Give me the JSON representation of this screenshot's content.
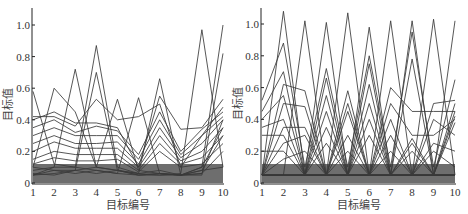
{
  "chart_data": [
    {
      "type": "line",
      "title": "",
      "xlabel": "目标编号",
      "ylabel": "目标值",
      "x": [
        1,
        2,
        3,
        4,
        5,
        6,
        7,
        8,
        9,
        10
      ],
      "xticks": [
        "1",
        "2",
        "3",
        "4",
        "5",
        "6",
        "7",
        "8",
        "9",
        "10"
      ],
      "yticks": [
        "0",
        "0.2",
        "0.4",
        "0.6",
        "0.8",
        "1.0"
      ],
      "ylim": [
        0,
        1.1
      ],
      "grid": false,
      "legend": "none",
      "line_color": "#3a3a3a",
      "series": [
        {
          "name": "s1",
          "values": [
            0.58,
            0.12,
            0.1,
            0.08,
            0.06,
            0.05,
            0.05,
            0.06,
            0.97,
            0.1
          ]
        },
        {
          "name": "s2",
          "values": [
            0.1,
            0.6,
            0.45,
            0.1,
            0.08,
            0.05,
            0.06,
            0.05,
            0.1,
            1.0
          ]
        },
        {
          "name": "s3",
          "values": [
            0.05,
            0.1,
            0.72,
            0.1,
            0.08,
            0.06,
            0.05,
            0.05,
            0.05,
            0.82
          ]
        },
        {
          "name": "s4",
          "values": [
            0.08,
            0.1,
            0.1,
            0.87,
            0.1,
            0.06,
            0.08,
            0.05,
            0.08,
            0.1
          ]
        },
        {
          "name": "s5",
          "values": [
            0.05,
            0.06,
            0.08,
            0.7,
            0.08,
            0.05,
            0.06,
            0.05,
            0.06,
            0.4
          ]
        },
        {
          "name": "s6",
          "values": [
            0.1,
            0.08,
            0.08,
            0.1,
            0.53,
            0.08,
            0.06,
            0.05,
            0.08,
            0.3
          ]
        },
        {
          "name": "s7",
          "values": [
            0.05,
            0.08,
            0.06,
            0.08,
            0.06,
            0.54,
            0.06,
            0.05,
            0.06,
            0.2
          ]
        },
        {
          "name": "s8",
          "values": [
            0.06,
            0.05,
            0.08,
            0.06,
            0.08,
            0.06,
            0.66,
            0.05,
            0.1,
            0.35
          ]
        },
        {
          "name": "s9",
          "values": [
            0.4,
            0.45,
            0.38,
            0.38,
            0.35,
            0.1,
            0.55,
            0.34,
            0.35,
            0.53
          ]
        },
        {
          "name": "s10",
          "values": [
            0.42,
            0.42,
            0.36,
            0.53,
            0.4,
            0.42,
            0.5,
            0.1,
            0.3,
            0.48
          ]
        },
        {
          "name": "s11",
          "values": [
            0.35,
            0.4,
            0.32,
            0.36,
            0.33,
            0.18,
            0.45,
            0.2,
            0.34,
            0.45
          ]
        },
        {
          "name": "s12",
          "values": [
            0.3,
            0.35,
            0.3,
            0.3,
            0.3,
            0.15,
            0.4,
            0.18,
            0.3,
            0.42
          ]
        },
        {
          "name": "s13",
          "values": [
            0.25,
            0.3,
            0.25,
            0.25,
            0.26,
            0.12,
            0.35,
            0.16,
            0.25,
            0.4
          ]
        },
        {
          "name": "s14",
          "values": [
            0.2,
            0.26,
            0.22,
            0.22,
            0.22,
            0.1,
            0.3,
            0.14,
            0.2,
            0.35
          ]
        },
        {
          "name": "s15",
          "values": [
            0.15,
            0.2,
            0.18,
            0.18,
            0.18,
            0.08,
            0.25,
            0.12,
            0.16,
            0.3
          ]
        },
        {
          "name": "s16",
          "values": [
            0.12,
            0.16,
            0.14,
            0.14,
            0.15,
            0.07,
            0.2,
            0.1,
            0.12,
            0.25
          ]
        }
      ]
    },
    {
      "type": "line",
      "title": "",
      "xlabel": "目标编号",
      "ylabel": "目标值",
      "x": [
        1,
        2,
        3,
        4,
        5,
        6,
        7,
        8,
        9,
        10
      ],
      "xticks": [
        "1",
        "2",
        "3",
        "4",
        "5",
        "6",
        "7",
        "8",
        "9",
        "10"
      ],
      "yticks": [
        "0",
        "0.2",
        "0.4",
        "0.6",
        "0.8",
        "1.0"
      ],
      "ylim": [
        0,
        1.1
      ],
      "grid": false,
      "legend": "none",
      "line_color": "#3a3a3a",
      "series": [
        {
          "name": "r1",
          "values": [
            0.05,
            1.08,
            0.05,
            0.05,
            0.05,
            0.05,
            0.05,
            0.05,
            0.05,
            0.05
          ]
        },
        {
          "name": "r2",
          "values": [
            0.05,
            0.05,
            1.02,
            0.05,
            0.05,
            0.05,
            0.05,
            0.05,
            0.05,
            0.05
          ]
        },
        {
          "name": "r3",
          "values": [
            0.05,
            0.05,
            0.05,
            1.01,
            0.05,
            0.05,
            0.05,
            0.05,
            0.05,
            0.05
          ]
        },
        {
          "name": "r4",
          "values": [
            0.05,
            0.05,
            0.05,
            0.05,
            1.07,
            0.05,
            0.05,
            0.05,
            0.05,
            0.05
          ]
        },
        {
          "name": "r5",
          "values": [
            0.05,
            0.05,
            0.05,
            0.05,
            0.05,
            0.98,
            0.05,
            0.05,
            0.05,
            0.05
          ]
        },
        {
          "name": "r6",
          "values": [
            0.05,
            0.05,
            0.05,
            0.05,
            0.05,
            0.05,
            1.02,
            0.05,
            0.05,
            0.05
          ]
        },
        {
          "name": "r7",
          "values": [
            0.05,
            0.05,
            0.05,
            0.05,
            0.05,
            0.05,
            0.05,
            1.02,
            0.05,
            0.05
          ]
        },
        {
          "name": "r8",
          "values": [
            0.05,
            0.05,
            0.05,
            0.05,
            0.05,
            0.05,
            0.05,
            0.05,
            1.03,
            0.05
          ]
        },
        {
          "name": "r9",
          "values": [
            0.05,
            0.05,
            0.05,
            0.05,
            0.05,
            0.05,
            0.05,
            0.05,
            0.05,
            1.02
          ]
        },
        {
          "name": "r10",
          "values": [
            0.52,
            0.88,
            0.1,
            0.72,
            0.1,
            0.8,
            0.1,
            0.95,
            0.1,
            0.65
          ]
        },
        {
          "name": "r11",
          "values": [
            0.45,
            0.7,
            0.05,
            0.66,
            0.05,
            0.75,
            0.05,
            0.78,
            0.05,
            0.5
          ]
        },
        {
          "name": "r12",
          "values": [
            0.05,
            0.62,
            0.58,
            0.05,
            0.58,
            0.05,
            0.6,
            0.45,
            0.45,
            0.45
          ]
        },
        {
          "name": "r13",
          "values": [
            0.4,
            0.55,
            0.05,
            0.55,
            0.05,
            0.62,
            0.05,
            0.05,
            0.5,
            0.52
          ]
        },
        {
          "name": "r14",
          "values": [
            0.05,
            0.5,
            0.48,
            0.05,
            0.5,
            0.05,
            0.5,
            0.3,
            0.3,
            0.4
          ]
        },
        {
          "name": "r15",
          "values": [
            0.35,
            0.4,
            0.05,
            0.45,
            0.05,
            0.5,
            0.05,
            0.28,
            0.05,
            0.42
          ]
        },
        {
          "name": "r16",
          "values": [
            0.05,
            0.35,
            0.35,
            0.05,
            0.45,
            0.05,
            0.4,
            0.05,
            0.4,
            0.3
          ]
        },
        {
          "name": "r17",
          "values": [
            0.3,
            0.3,
            0.05,
            0.35,
            0.05,
            0.4,
            0.05,
            0.25,
            0.05,
            0.38
          ]
        },
        {
          "name": "r18",
          "values": [
            0.05,
            0.25,
            0.3,
            0.05,
            0.3,
            0.05,
            0.3,
            0.05,
            0.25,
            0.2
          ]
        },
        {
          "name": "r19",
          "values": [
            0.2,
            0.2,
            0.05,
            0.25,
            0.05,
            0.3,
            0.05,
            0.2,
            0.05,
            0.45
          ]
        },
        {
          "name": "r20",
          "values": [
            0.05,
            0.15,
            0.2,
            0.05,
            0.2,
            0.05,
            0.2,
            0.05,
            0.2,
            0.1
          ]
        }
      ]
    }
  ]
}
